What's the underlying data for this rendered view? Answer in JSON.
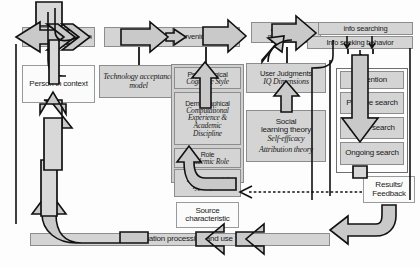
{
  "diagram": {
    "colors": {
      "box_fill": "#d4d4d4",
      "box_fill_white": "#fbfbfb",
      "border": "#8d8d8d",
      "arrow_fill": "#c9c9c9",
      "arrow_stroke": "#111111",
      "text": "#1a1a1a"
    },
    "nodes": {
      "context_of_interaction": "Context of interaction",
      "person_in_context": "Person in context",
      "activating_mechanism_1": "Activating mechanism",
      "technology_acceptance_model": "Technology acceptance model",
      "intervening_variables": "Intervening variables",
      "psychological_header": "Psychological",
      "psychological_sub": "Cognitive Style",
      "demographical_header": "Demographical",
      "demographical_sub_1": "Computational",
      "demographical_sub_2": "Experience &",
      "demographical_sub_3": "Academic",
      "demographical_sub_4": "Discipline",
      "role_header": "Role",
      "role_sub": "Academic Role",
      "environmental_header": "Environmental",
      "environmental_sub": "Type of use",
      "source_characteristic": "Source characteristic",
      "activating_mechanism_2": "Activating mechanism",
      "user_judgments_header": "User Judgments",
      "user_judgments_sub": "IQ Dimensions",
      "social_learning_theory_1": "Social",
      "social_learning_theory_2": "learning theory",
      "self_efficacy": "Self-efficacy",
      "attribution_theory": "Attribution theory",
      "info_searching": "info searching",
      "info_seeking_behavior": "Info seeking behavior",
      "attention": "Attention",
      "passive_search": "Passive search",
      "active_search": "Active search",
      "ongoing_search": "Ongoing search",
      "results_feedback_1": "Results/",
      "results_feedback_2": "Feedback",
      "information_processing_and_use": "Information processing and use"
    }
  }
}
